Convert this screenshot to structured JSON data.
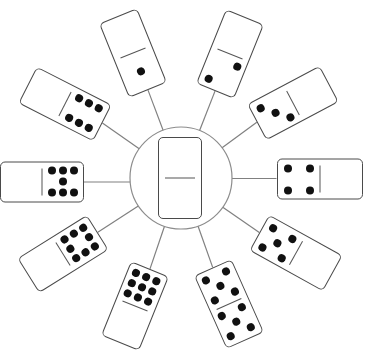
{
  "figure": {
    "colors": {
      "background": "#ffffff",
      "pip": "#111111",
      "domino_outline": "#4a4a4a",
      "hub_circle": "#8c8c8c",
      "spoke": "#808080"
    }
  },
  "hub": {
    "domino": {
      "top": 0,
      "bottom": 0
    }
  },
  "dominoes": [
    {
      "position": "top-left",
      "outer": 0,
      "inner": 1
    },
    {
      "position": "top-right",
      "outer": 0,
      "inner": 2
    },
    {
      "position": "upper-right",
      "outer": 0,
      "inner": 3
    },
    {
      "position": "right",
      "outer": 0,
      "inner": 4
    },
    {
      "position": "lower-right",
      "outer": 0,
      "inner": 5
    },
    {
      "position": "bottom-right",
      "outer": 5,
      "inner": 5
    },
    {
      "position": "bottom-left",
      "outer": 0,
      "inner": 9
    },
    {
      "position": "lower-left",
      "outer": 0,
      "inner": 8
    },
    {
      "position": "left",
      "outer": 0,
      "inner": 7
    },
    {
      "position": "upper-left",
      "outer": 0,
      "inner": 6
    }
  ]
}
